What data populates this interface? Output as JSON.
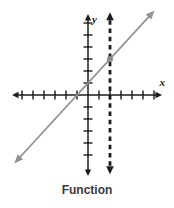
{
  "figure": {
    "background": "#ffffff"
  },
  "chart_data": {
    "type": "line",
    "title": "Function",
    "axes": {
      "x_label": "x",
      "y_label": "y",
      "x_range": [
        -7,
        7
      ],
      "y_range": [
        -7,
        7
      ],
      "x_tick_range": [
        -6,
        6
      ],
      "y_tick_range": [
        -5,
        6
      ],
      "tick_step": 1,
      "grid": false,
      "color": "#1c1c1c"
    },
    "series": [
      {
        "name": "function-line",
        "kind": "linear",
        "equation": "y = x + 1",
        "slope": 1,
        "intercept": 1,
        "x_extent": [
          -6.7,
          6.05
        ],
        "style": "solid",
        "arrows": "both",
        "color": "#949494"
      },
      {
        "name": "vertical-dashed-line",
        "kind": "vertical",
        "equation": "x = 2",
        "x": 2,
        "y_extent": [
          -6.6,
          6.9
        ],
        "style": "dashed",
        "arrows": "both",
        "color": "#1c1c1c"
      }
    ],
    "points": [
      {
        "name": "intersection-point",
        "x": 2,
        "y": 3,
        "color": "#8a8a8a"
      }
    ]
  }
}
